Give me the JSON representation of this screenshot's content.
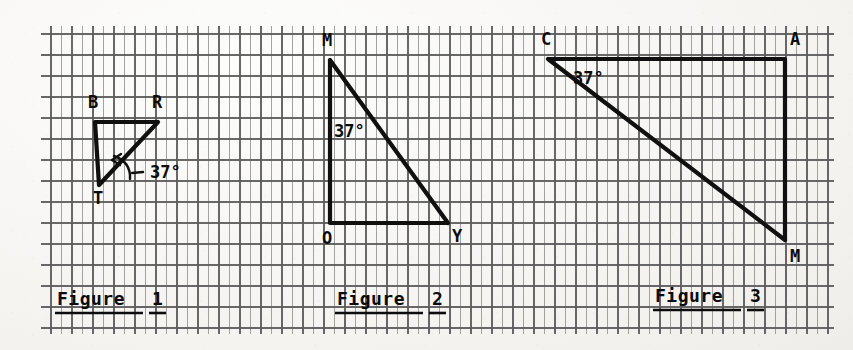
{
  "page": {
    "background_color": "#f4f3f0",
    "ink_color": "#101010",
    "grid_color": "#5c5c5c",
    "grid_spacing_px": 21,
    "grid_origin": {
      "x": 51,
      "y": 34
    },
    "grid_extent": {
      "right": 830,
      "bottom": 328
    }
  },
  "figures": [
    {
      "id": "figure-1",
      "caption": "Figure 1",
      "caption_number": "1",
      "angle_label": "37°",
      "angle_value": 37,
      "angle_at_vertex": "R",
      "shape": "right-triangle",
      "vertices": [
        {
          "name": "B",
          "x": 95,
          "y": 122,
          "label_x": 88,
          "label_y": 108
        },
        {
          "name": "R",
          "x": 158,
          "y": 122,
          "label_x": 152,
          "label_y": 108
        },
        {
          "name": "T",
          "x": 99,
          "y": 185,
          "label_x": 93,
          "label_y": 204
        }
      ],
      "edges": [
        [
          "B",
          "R"
        ],
        [
          "B",
          "T"
        ],
        [
          "R",
          "T"
        ]
      ],
      "angle_marker": {
        "type": "arc-with-arrow",
        "arc_center_x": 128,
        "arc_center_y": 165,
        "label_x": 150,
        "label_y": 178
      }
    },
    {
      "id": "figure-2",
      "caption": "Figure 2",
      "caption_number": "2",
      "angle_label": "37°",
      "angle_value": 37,
      "angle_at_vertex": "M",
      "shape": "right-triangle",
      "vertices": [
        {
          "name": "M",
          "x": 330,
          "y": 60,
          "label_x": 322,
          "label_y": 46
        },
        {
          "name": "O",
          "x": 330,
          "y": 223,
          "label_x": 322,
          "label_y": 244
        },
        {
          "name": "Y",
          "x": 448,
          "y": 223,
          "label_x": 452,
          "label_y": 242
        }
      ],
      "edges": [
        [
          "M",
          "O"
        ],
        [
          "O",
          "Y"
        ],
        [
          "M",
          "Y"
        ]
      ],
      "angle_marker": {
        "type": "text-only",
        "label_x": 334,
        "label_y": 137
      }
    },
    {
      "id": "figure-3",
      "caption": "Figure 3",
      "caption_number": "3",
      "angle_label": "37°",
      "angle_value": 37,
      "angle_at_vertex": "C",
      "shape": "right-triangle",
      "vertices": [
        {
          "name": "C",
          "x": 548,
          "y": 59,
          "label_x": 541,
          "label_y": 45
        },
        {
          "name": "A",
          "x": 785,
          "y": 59,
          "label_x": 790,
          "label_y": 45
        },
        {
          "name": "M",
          "x": 785,
          "y": 240,
          "label_x": 790,
          "label_y": 262
        }
      ],
      "edges": [
        [
          "C",
          "A"
        ],
        [
          "A",
          "M"
        ],
        [
          "C",
          "M"
        ]
      ],
      "angle_marker": {
        "type": "text-only",
        "label_x": 573,
        "label_y": 84
      }
    }
  ],
  "captions": [
    {
      "text": "Figure",
      "number": "1",
      "text_x": 57,
      "text_y": 305,
      "rule_x1": 55,
      "rule_x2": 143,
      "num_x": 152,
      "rule2_x1": 149,
      "rule2_x2": 166,
      "rule_y": 313
    },
    {
      "text": "Figure",
      "number": "2",
      "text_x": 337,
      "text_y": 305,
      "rule_x1": 335,
      "rule_x2": 423,
      "num_x": 432,
      "rule2_x1": 429,
      "rule2_x2": 446,
      "rule_y": 313
    },
    {
      "text": "Figure",
      "number": "3",
      "text_x": 655,
      "text_y": 302,
      "rule_x1": 653,
      "rule_x2": 741,
      "num_x": 750,
      "rule2_x1": 747,
      "rule2_x2": 764,
      "rule_y": 310
    }
  ]
}
